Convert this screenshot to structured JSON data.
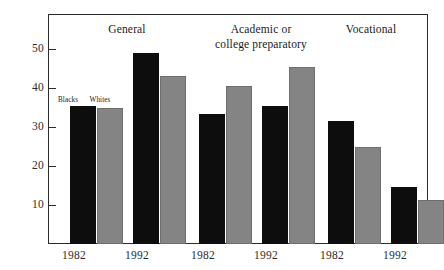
{
  "chart_data": {
    "type": "bar",
    "title": "",
    "subtitle": "",
    "xlabel": "",
    "ylabel": "",
    "ylim": [
      0,
      55
    ],
    "yticks": [
      10,
      20,
      30,
      40,
      50
    ],
    "ytick_labels": [
      "10",
      "20",
      "30",
      "40",
      "50"
    ],
    "grid": false,
    "legend_position": "inside-upper-left",
    "categories": [
      "1982",
      "1992",
      "1982",
      "1992",
      "1982",
      "1992"
    ],
    "group_labels": [
      "General",
      "Academic or\ncollege preparatory",
      "Vocational"
    ],
    "groups": [
      {
        "name": "General",
        "title_line1": "General",
        "title_line2": "",
        "years": [
          {
            "year": "1982",
            "Blacks": 35.5,
            "Whites": 34.8
          },
          {
            "year": "1992",
            "Blacks": 49.0,
            "Whites": 43.0
          }
        ]
      },
      {
        "name": "Academic or college preparatory",
        "title_line1": "Academic or",
        "title_line2": "college preparatory",
        "years": [
          {
            "year": "1982",
            "Blacks": 33.3,
            "Whites": 40.5
          },
          {
            "year": "1992",
            "Blacks": 35.5,
            "Whites": 45.5
          }
        ]
      },
      {
        "name": "Vocational",
        "title_line1": "Vocational",
        "title_line2": "",
        "years": [
          {
            "year": "1982",
            "Blacks": 31.5,
            "Whites": 24.8
          },
          {
            "year": "1992",
            "Blacks": 14.6,
            "Whites": 11.2
          }
        ]
      }
    ],
    "series": [
      {
        "name": "Blacks",
        "color": "#0d0d0d",
        "values": [
          35.5,
          49.0,
          33.3,
          35.5,
          31.5,
          14.6
        ]
      },
      {
        "name": "Whites",
        "color": "#848484",
        "values": [
          34.8,
          43.0,
          40.5,
          45.5,
          24.8,
          11.2
        ]
      }
    ],
    "legend": [
      {
        "label": "Blacks",
        "color": "#0d0d0d"
      },
      {
        "label": "Whites",
        "color": "#848484"
      }
    ]
  },
  "axes": {
    "y_tick_labels": [
      "50",
      "40",
      "30",
      "20",
      "10"
    ],
    "x_tick_labels": [
      "1982",
      "1992",
      "1982",
      "1992",
      "1982",
      "1992"
    ]
  },
  "colors": {
    "blacks_bar": "#0d0d0d",
    "whites_bar": "#848484",
    "frame": "#2b2b2b",
    "background": "#ffffff",
    "text": "#1a1a1a"
  }
}
